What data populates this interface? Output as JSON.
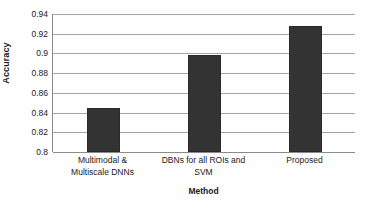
{
  "chart_data": {
    "type": "bar",
    "title": "",
    "categories": [
      "Multimodal & Multiscale DNNs",
      "DBNs for all ROIs and SVM",
      "Proposed"
    ],
    "category_lines": [
      [
        "Multimodal &",
        "Multiscale DNNs"
      ],
      [
        "DBNs for all ROIs and",
        "SVM"
      ],
      [
        "Proposed"
      ]
    ],
    "values": [
      0.845,
      0.898,
      0.928
    ],
    "xlabel": "Method",
    "ylabel": "Accuracy",
    "ylim": [
      0.8,
      0.94
    ],
    "ytick_labels": [
      "0.8",
      "0.82",
      "0.84",
      "0.86",
      "0.88",
      "0.9",
      "0.92",
      "0.94"
    ],
    "ytick_values": [
      0.8,
      0.82,
      0.84,
      0.86,
      0.88,
      0.9,
      0.92,
      0.94
    ],
    "grid": true,
    "legend": false,
    "bar_color": "#333333",
    "gridline_color": "#a6a6a6",
    "axis_color": "#8a8a8a",
    "background_color": "#fefefe"
  }
}
